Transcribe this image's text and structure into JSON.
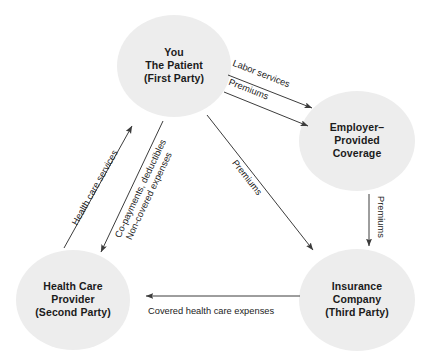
{
  "diagram": {
    "background_color": "#ffffff",
    "node_fill_color": "#ededed",
    "text_color": "#1b1b1b",
    "arrow_color": "#3c3c3c",
    "nodes": [
      {
        "id": "patient",
        "lines": [
          "You",
          "The Patient",
          "(First Party)"
        ],
        "line1": "You",
        "line2": "The Patient",
        "line3": "(First Party)"
      },
      {
        "id": "employer",
        "lines": [
          "Employer–",
          "Provided",
          "Coverage"
        ],
        "line1": "Employer–",
        "line2": "Provided",
        "line3": "Coverage"
      },
      {
        "id": "provider",
        "lines": [
          "Health Care",
          "Provider",
          "(Second Party)"
        ],
        "line1": "Health Care",
        "line2": "Provider",
        "line3": "(Second Party)"
      },
      {
        "id": "insurer",
        "lines": [
          "Insurance",
          "Company",
          "(Third Party)"
        ],
        "line1": "Insurance",
        "line2": "Company",
        "line3": "(Third Party)"
      }
    ],
    "edges": [
      {
        "id": "labor-services",
        "label": "Labor services",
        "from": "patient",
        "to": "employer",
        "direction": "down-right"
      },
      {
        "id": "premiums-to-employer",
        "label": "Premiums",
        "from": "patient",
        "to": "employer",
        "direction": "down-right"
      },
      {
        "id": "premiums-to-insurer",
        "label": "Premiums",
        "from": "patient",
        "to": "insurer",
        "direction": "down-right"
      },
      {
        "id": "premiums-employer-to-insurer",
        "label": "Premiums",
        "from": "employer",
        "to": "insurer",
        "direction": "down"
      },
      {
        "id": "covered-expenses",
        "label": "Covered health care expenses",
        "from": "insurer",
        "to": "provider",
        "direction": "left"
      },
      {
        "id": "health-care-services",
        "label": "Health care services",
        "from": "provider",
        "to": "patient",
        "direction": "up-right"
      },
      {
        "id": "patient-payments",
        "label_line1": "Co-payments, deductibles",
        "label_line2": "Non-covered expenses",
        "from": "patient",
        "to": "provider",
        "direction": "down-left"
      }
    ]
  }
}
